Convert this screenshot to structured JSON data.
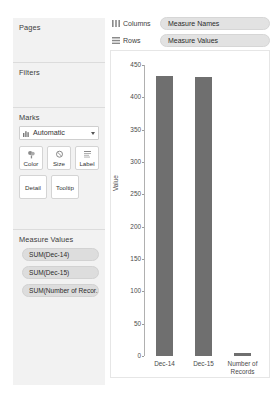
{
  "sidebar": {
    "pages": {
      "title": "Pages"
    },
    "filters": {
      "title": "Filters"
    },
    "marks": {
      "title": "Marks",
      "mark_type": "Automatic",
      "buttons": [
        {
          "label": "Color",
          "icon": "color-palette-icon"
        },
        {
          "label": "Size",
          "icon": "size-circle-icon"
        },
        {
          "label": "Label",
          "icon": "label-text-icon"
        },
        {
          "label": "Detail",
          "icon": "detail-icon"
        },
        {
          "label": "Tooltip",
          "icon": "tooltip-icon"
        }
      ]
    },
    "measure_values": {
      "title": "Measure Values",
      "pills": [
        "SUM(Dec-14)",
        "SUM(Dec-15)",
        "SUM(Number of Recor.."
      ]
    }
  },
  "shelves": [
    {
      "label": "Columns",
      "icon": "columns-icon",
      "pill": "Measure Names"
    },
    {
      "label": "Rows",
      "icon": "rows-icon",
      "pill": "Measure Values"
    }
  ],
  "chart_data": {
    "type": "bar",
    "title": "",
    "xlabel": "",
    "ylabel": "Value",
    "categories": [
      "Dec-14",
      "Dec-15",
      "Number of Records"
    ],
    "values": [
      433,
      431,
      4
    ],
    "ylim": [
      0,
      450
    ],
    "yticks": [
      450,
      400,
      350,
      300,
      250,
      200,
      150,
      100,
      50,
      0
    ],
    "grid": false,
    "legend": "none",
    "bar_color": "#6f6f6f"
  },
  "colors": {
    "bar": "#6f6f6f",
    "panel": "#f2f2f2",
    "pill": "#dddddd",
    "shelf_pill": "#e2e2e2",
    "text": "#3c3c3c"
  }
}
